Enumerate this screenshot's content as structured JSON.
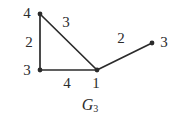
{
  "figure": {
    "caption_base": "G",
    "caption_sub": "3",
    "background_color": "#ffffff",
    "ink_color": "#2b2b2b",
    "width": 176,
    "height": 123
  },
  "graph_data": {
    "type": "node-link-diagram",
    "directed": false,
    "vertex_label_meaning": "vertex weight/degree label",
    "edge_label_meaning": "edge weight label",
    "vertices": [
      {
        "id": "v4",
        "label": "4",
        "x": 40,
        "y": 14,
        "label_x": 27,
        "label_y": 13
      },
      {
        "id": "v3l",
        "label": "3",
        "x": 40,
        "y": 70,
        "label_x": 27,
        "label_y": 70
      },
      {
        "id": "v1",
        "label": "1",
        "x": 97,
        "y": 70,
        "label_x": 96,
        "label_y": 83
      },
      {
        "id": "v3r",
        "label": "3",
        "x": 152,
        "y": 43,
        "label_x": 164,
        "label_y": 42
      }
    ],
    "edges": [
      {
        "from": "v4",
        "to": "v3l",
        "label": "2",
        "label_x": 29,
        "label_y": 42
      },
      {
        "from": "v4",
        "to": "v1",
        "label": "3",
        "label_x": 66,
        "label_y": 22
      },
      {
        "from": "v3l",
        "to": "v1",
        "label": "4",
        "label_x": 67,
        "label_y": 83
      },
      {
        "from": "v1",
        "to": "v3r",
        "label": "2",
        "label_x": 121,
        "label_y": 38
      }
    ],
    "caption": "G3"
  }
}
